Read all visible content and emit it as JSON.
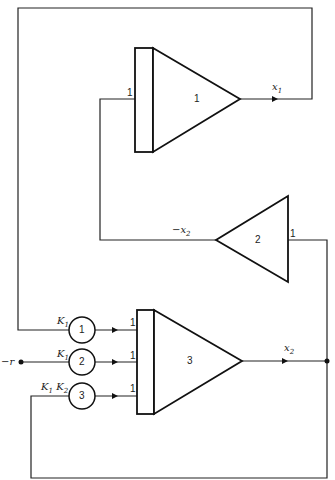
{
  "diagram": {
    "type": "analog computer block diagram",
    "amplifiers": [
      {
        "id": "amp1",
        "label": "1",
        "input_gain": "1",
        "output": "x",
        "output_sub": "1"
      },
      {
        "id": "amp2",
        "label": "2",
        "input_gain": "1",
        "output": "−x",
        "output_sub": "2"
      },
      {
        "id": "amp3",
        "label": "3",
        "input_gains": [
          "1",
          "1",
          "1"
        ],
        "output": "x",
        "output_sub": "2"
      }
    ],
    "potentiometers": [
      {
        "id": "pot1",
        "label": "1",
        "coef": "K",
        "coef_sub": "1"
      },
      {
        "id": "pot2",
        "label": "2",
        "coef": "K",
        "coef_sub": "1"
      },
      {
        "id": "pot3",
        "label": "3",
        "coef": "K",
        "coef_sub": "1",
        "coef2": "K",
        "coef2_sub": "2"
      }
    ],
    "input": {
      "label": "−r"
    }
  }
}
